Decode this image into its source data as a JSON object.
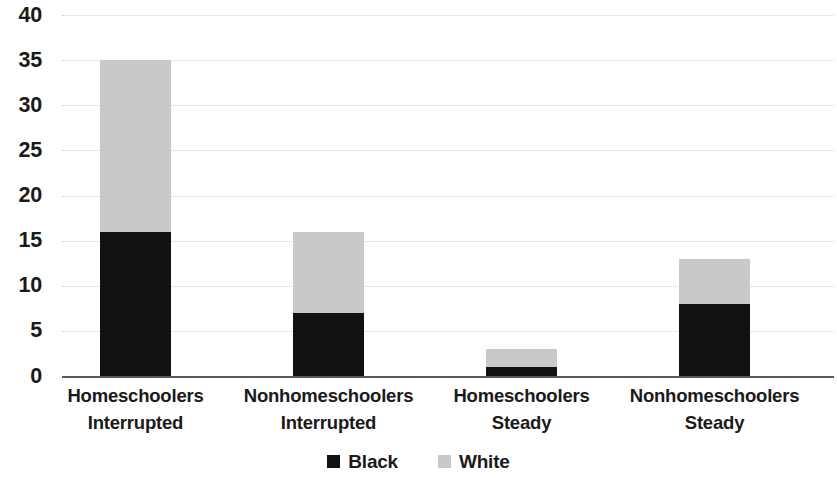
{
  "chart_data": {
    "type": "bar",
    "subtype": "stacked-vertical",
    "title": "",
    "subtitle": "",
    "xlabel": "",
    "ylabel": "",
    "ylim": [
      0,
      40
    ],
    "ytick_step": 5,
    "ytick_labels": [
      "40",
      "35",
      "30",
      "25",
      "20",
      "15",
      "10",
      "5",
      "0"
    ],
    "ytick_values": [
      40,
      35,
      30,
      25,
      20,
      15,
      10,
      5,
      0
    ],
    "grid": true,
    "grid_axis": "y",
    "grid_style": "dotted",
    "legend_position": "bottom-center",
    "categories": [
      "Homeschoolers Interrupted",
      "Nonhomeschoolers Interrupted",
      "Homeschoolers Steady",
      "Nonhomeschoolers Steady"
    ],
    "category_lines": [
      [
        "Homeschoolers",
        "Interrupted"
      ],
      [
        "Nonhomeschoolers",
        "Interrupted"
      ],
      [
        "Homeschoolers",
        "Steady"
      ],
      [
        "Nonhomeschoolers",
        "Steady"
      ]
    ],
    "series": [
      {
        "name": "Black",
        "color": "#111111",
        "values": [
          16,
          7,
          1,
          8
        ]
      },
      {
        "name": "White",
        "color": "#c9c9c9",
        "values": [
          19,
          9,
          2,
          5
        ]
      }
    ],
    "totals": [
      35,
      16,
      3,
      13
    ]
  },
  "legend": {
    "items": [
      {
        "label": "Black",
        "color": "#111111"
      },
      {
        "label": "White",
        "color": "#c9c9c9"
      }
    ]
  },
  "axis": {
    "zero_line_color": "#58595b",
    "gridline_color": "#d2d2d2"
  }
}
